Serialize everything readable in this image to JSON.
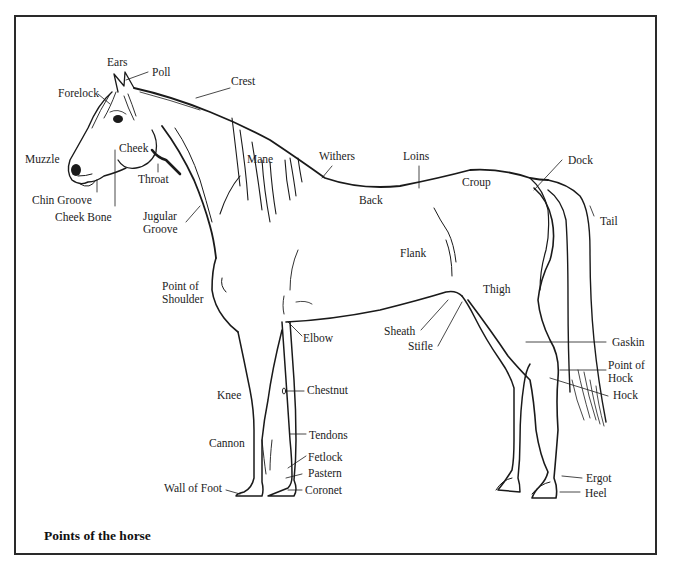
{
  "title": "Points of the horse",
  "labels": {
    "ears": "Ears",
    "poll": "Poll",
    "crest": "Crest",
    "forelock": "Forelock",
    "muzzle": "Muzzle",
    "cheek": "Cheek",
    "throat": "Throat",
    "chin_groove": "Chin Groove",
    "cheek_bone": "Cheek Bone",
    "jugular_groove": "Jugular\nGroove",
    "mane": "Mane",
    "withers": "Withers",
    "loins": "Loins",
    "back": "Back",
    "croup": "Croup",
    "dock": "Dock",
    "tail": "Tail",
    "flank": "Flank",
    "thigh": "Thigh",
    "point_of_shoulder": "Point of\nShoulder",
    "elbow": "Elbow",
    "sheath": "Sheath",
    "stifle": "Stifle",
    "gaskin": "Gaskin",
    "point_of_hock": "Point of\nHock",
    "hock": "Hock",
    "knee": "Knee",
    "chestnut": "Chestnut",
    "cannon": "Cannon",
    "tendons": "Tendons",
    "fetlock": "Fetlock",
    "pastern": "Pastern",
    "coronet": "Coronet",
    "wall_of_foot": "Wall of Foot",
    "ergot": "Ergot",
    "heel": "Heel"
  },
  "colors": {
    "ink": "#1a1a1a",
    "frame": "#2a2a2a",
    "background": "#ffffff"
  }
}
